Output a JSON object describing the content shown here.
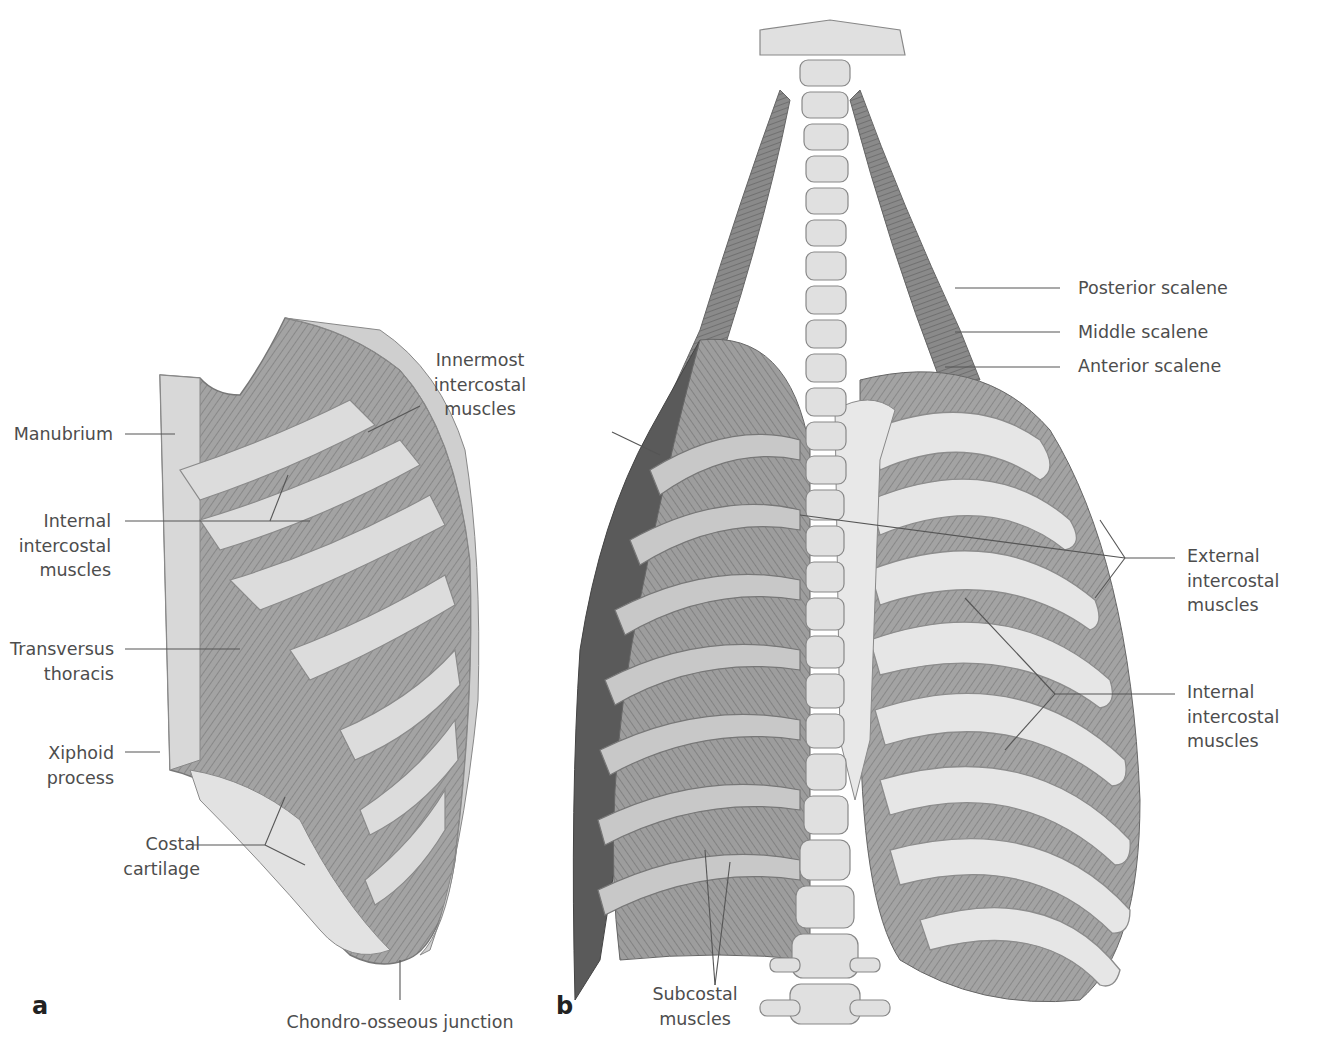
{
  "figure": {
    "panels": [
      {
        "id": "a",
        "letter": "a",
        "labels": {
          "manubrium": "Manubrium",
          "internal_intercostal": "Internal\nintercostal\nmuscles",
          "transversus_thoracis": "Transversus\nthoracis",
          "xiphoid": "Xiphoid\nprocess",
          "costal_cartilage": "Costal\ncartilage",
          "chondro_osseous": "Chondro-osseous junction",
          "innermost_intercostal": "Innermost\nintercostal\nmuscles"
        }
      },
      {
        "id": "b",
        "letter": "b",
        "labels": {
          "posterior_scalene": "Posterior scalene",
          "middle_scalene": "Middle scalene",
          "anterior_scalene": "Anterior scalene",
          "external_intercostal": "External\nintercostal\nmuscles",
          "internal_intercostal": "Internal\nintercostal\nmuscles",
          "subcostal": "Subcostal\nmuscles"
        }
      }
    ],
    "colors": {
      "bone": "#e4e4e4",
      "muscle": "#9a9a9a",
      "muscle_dark": "#6e6e6e",
      "leader_line": "#555555",
      "text": "#4d4d4d"
    }
  }
}
